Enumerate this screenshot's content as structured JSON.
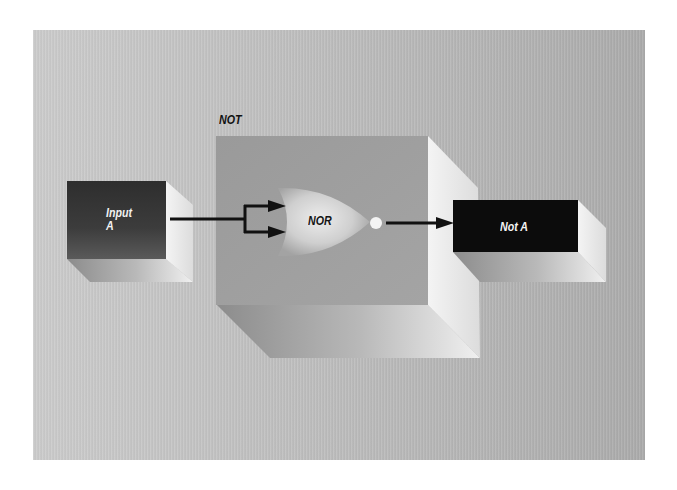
{
  "diagram": {
    "title": "NOT",
    "input_block": {
      "label_line1": "Input",
      "label_line2": "A"
    },
    "gate": {
      "label": "NOR",
      "type": "NOR gate with both inputs tied"
    },
    "output_block": {
      "label": "Not A"
    },
    "connections": [
      {
        "from": "Input A",
        "to": "NOR input 1"
      },
      {
        "from": "Input A",
        "to": "NOR input 2"
      },
      {
        "from": "NOR output (inversion bubble)",
        "to": "Not A"
      }
    ]
  },
  "colors": {
    "panel_light": "#cbcbcb",
    "panel_dark": "#aaaaaa",
    "not_box_face": "#9e9e9e",
    "box_highlight": "#f2f2f2",
    "input_block": "#3a3a3a",
    "output_block": "#0c0c0c",
    "wire": "#111111"
  }
}
